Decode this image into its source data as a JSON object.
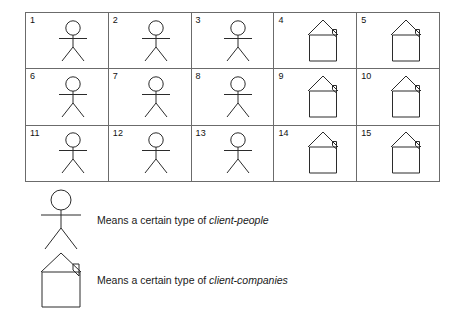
{
  "figure": {
    "type": "legend-diagram",
    "background_color": "#ffffff",
    "line_color": "#2b2b2b",
    "grid_border_color": "#6b6b6b"
  },
  "grid": {
    "columns": 5,
    "rows": 3,
    "cells": [
      {
        "number": "1",
        "glyph": "stick-figure-person"
      },
      {
        "number": "2",
        "glyph": "stick-figure-person"
      },
      {
        "number": "3",
        "glyph": "stick-figure-person"
      },
      {
        "number": "4",
        "glyph": "house-building"
      },
      {
        "number": "5",
        "glyph": "house-building"
      },
      {
        "number": "6",
        "glyph": "stick-figure-person"
      },
      {
        "number": "7",
        "glyph": "stick-figure-person"
      },
      {
        "number": "8",
        "glyph": "stick-figure-person"
      },
      {
        "number": "9",
        "glyph": "house-building"
      },
      {
        "number": "10",
        "glyph": "house-building"
      },
      {
        "number": "11",
        "glyph": "stick-figure-person"
      },
      {
        "number": "12",
        "glyph": "stick-figure-person"
      },
      {
        "number": "13",
        "glyph": "stick-figure-person"
      },
      {
        "number": "14",
        "glyph": "house-building"
      },
      {
        "number": "15",
        "glyph": "house-building"
      }
    ]
  },
  "legend": {
    "entries": [
      {
        "glyph": "stick-figure-person",
        "prefix": "Means a certain type of ",
        "emphasis": "client-people"
      },
      {
        "glyph": "house-building",
        "prefix": "Means a certain type of ",
        "emphasis": "client-companies"
      }
    ]
  }
}
